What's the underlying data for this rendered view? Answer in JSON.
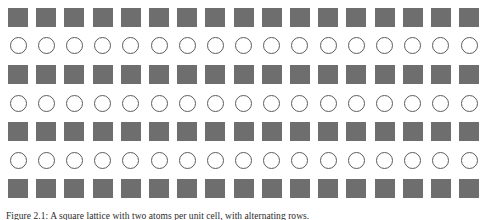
{
  "figure": {
    "caption": "Figure 2.1: A square lattice with two atoms per unit cell, with alternating rows.",
    "colors": {
      "square_fill": "#6e6e6e",
      "circle_stroke": "#5c5c5c",
      "background": "#ffffff",
      "caption_text": "#2b2b2b"
    },
    "grid": {
      "columns": 17,
      "rows": 7,
      "row_types": [
        "square",
        "circle",
        "square",
        "circle",
        "square",
        "circle",
        "square"
      ],
      "square_label": "filled-square",
      "circle_label": "open-circle",
      "column_indices": [
        1,
        2,
        3,
        4,
        5,
        6,
        7,
        8,
        9,
        10,
        11,
        12,
        13,
        14,
        15,
        16,
        17
      ],
      "row_indices": [
        1,
        2,
        3,
        4,
        5,
        6,
        7
      ]
    }
  }
}
